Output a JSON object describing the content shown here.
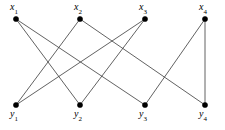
{
  "figure": {
    "width": 225,
    "height": 130,
    "background_color": "#ffffff",
    "edge_color": "#3a3a3a",
    "vertex_color": "#000000"
  },
  "vertices": {
    "top_row": [
      {
        "id": "x1",
        "base": "x",
        "sub": "1",
        "cx": 16,
        "cy": 19,
        "label_x": 10,
        "label_y": 2
      },
      {
        "id": "x2",
        "base": "x",
        "sub": "2",
        "cx": 80,
        "cy": 19,
        "label_x": 74,
        "label_y": 2
      },
      {
        "id": "x3",
        "base": "x",
        "sub": "3",
        "cx": 145,
        "cy": 19,
        "label_x": 139,
        "label_y": 2
      },
      {
        "id": "x4",
        "base": "x",
        "sub": "4",
        "cx": 205,
        "cy": 19,
        "label_x": 199,
        "label_y": 2
      }
    ],
    "bottom_row": [
      {
        "id": "y1",
        "base": "y",
        "sub": "1",
        "cx": 16,
        "cy": 105,
        "label_x": 10,
        "label_y": 109
      },
      {
        "id": "y2",
        "base": "y",
        "sub": "2",
        "cx": 80,
        "cy": 105,
        "label_x": 74,
        "label_y": 109
      },
      {
        "id": "y3",
        "base": "y",
        "sub": "3",
        "cx": 145,
        "cy": 105,
        "label_x": 139,
        "label_y": 109
      },
      {
        "id": "y4",
        "base": "y",
        "sub": "4",
        "cx": 205,
        "cy": 105,
        "label_x": 199,
        "label_y": 109
      }
    ]
  },
  "edges": [
    {
      "from": "x1",
      "to": "y2",
      "x1": 16,
      "y1": 19,
      "x2": 80,
      "y2": 105
    },
    {
      "from": "x1",
      "to": "y3",
      "x1": 16,
      "y1": 19,
      "x2": 145,
      "y2": 105
    },
    {
      "from": "x2",
      "to": "y1",
      "x1": 80,
      "y1": 19,
      "x2": 16,
      "y2": 105
    },
    {
      "from": "x2",
      "to": "y4",
      "x1": 80,
      "y1": 19,
      "x2": 205,
      "y2": 105
    },
    {
      "from": "x3",
      "to": "y1",
      "x1": 145,
      "y1": 19,
      "x2": 16,
      "y2": 105
    },
    {
      "from": "x3",
      "to": "y2",
      "x1": 145,
      "y1": 19,
      "x2": 80,
      "y2": 105
    },
    {
      "from": "x4",
      "to": "y3",
      "x1": 205,
      "y1": 19,
      "x2": 145,
      "y2": 105
    },
    {
      "from": "x4",
      "to": "y4",
      "x1": 205,
      "y1": 19,
      "x2": 205,
      "y2": 105
    }
  ],
  "vertex_radius": 2.6
}
